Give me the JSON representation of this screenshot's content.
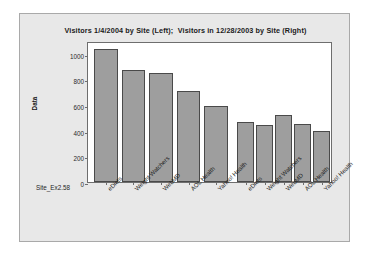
{
  "chart_data": {
    "type": "bar",
    "title": "Visitors 1/4/2004 by Site (Left);  Visitors in 12/28/2003 by Site (Right)",
    "xlabel": "Site_Ex2.58",
    "ylabel": "Data",
    "ylim": [
      0,
      1100
    ],
    "yticks": [
      0,
      200,
      400,
      600,
      800,
      1000
    ],
    "ytick_labels": [
      "0",
      "200",
      "400",
      "600",
      "800",
      "1000"
    ],
    "grid": false,
    "legend": "none",
    "panels": [
      {
        "name": "Visitors 1/4/2004 by Site (Left)",
        "categories": [
          "eDiets",
          "Weight Watchers",
          "WebMD",
          "AOL Health",
          "Yahoo! Health"
        ],
        "values": [
          1035,
          875,
          850,
          712,
          590
        ]
      },
      {
        "name": "Visitors in 12/28/2003 by Site (Right)",
        "categories": [
          "eDiets",
          "Weight Watchers",
          "WebMD",
          "AOL Health",
          "Yahoo! Health"
        ],
        "values": [
          470,
          443,
          525,
          450,
          396
        ]
      }
    ]
  }
}
